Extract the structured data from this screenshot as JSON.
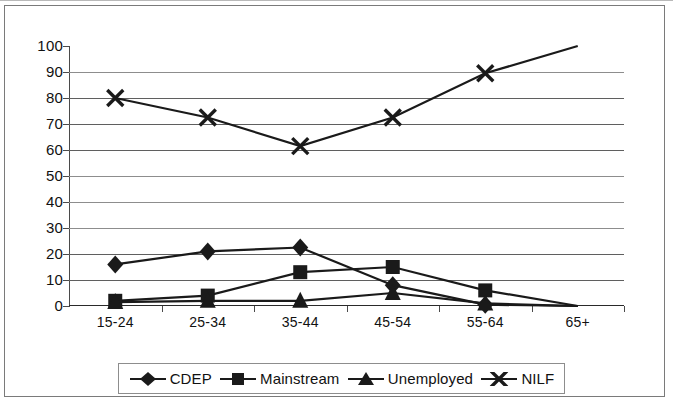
{
  "chart_data": {
    "type": "line",
    "title": "",
    "xlabel": "",
    "ylabel": "",
    "ylim": [
      0,
      100
    ],
    "ytick_step": 10,
    "yticks": [
      "0",
      "10",
      "20",
      "30",
      "40",
      "50",
      "60",
      "70",
      "80",
      "90",
      "100"
    ],
    "categories": [
      "15-24",
      "25-34",
      "35-44",
      "45-54",
      "55-64",
      "65+"
    ],
    "grid": true,
    "grid_axis": "y",
    "legend_position": "bottom",
    "series": [
      {
        "name": "CDEP",
        "marker": "diamond",
        "color": "#1a1a1a",
        "values": [
          16,
          21,
          22.5,
          8,
          0.5,
          0
        ]
      },
      {
        "name": "Mainstream",
        "marker": "square",
        "color": "#1a1a1a",
        "values": [
          2,
          4,
          13,
          15,
          6,
          0
        ]
      },
      {
        "name": "Unemployed",
        "marker": "triangle",
        "color": "#1a1a1a",
        "values": [
          1.5,
          2,
          2,
          5,
          1,
          0
        ]
      },
      {
        "name": "NILF",
        "marker": "cross",
        "color": "#1a1a1a",
        "values": [
          80,
          72.5,
          61.5,
          72.5,
          89.5,
          100
        ]
      }
    ]
  },
  "legend": {
    "items": [
      {
        "label": "CDEP",
        "marker": "diamond-marker-icon"
      },
      {
        "label": "Mainstream",
        "marker": "square-marker-icon"
      },
      {
        "label": "Unemployed",
        "marker": "triangle-marker-icon"
      },
      {
        "label": "NILF",
        "marker": "cross-marker-icon"
      }
    ]
  }
}
